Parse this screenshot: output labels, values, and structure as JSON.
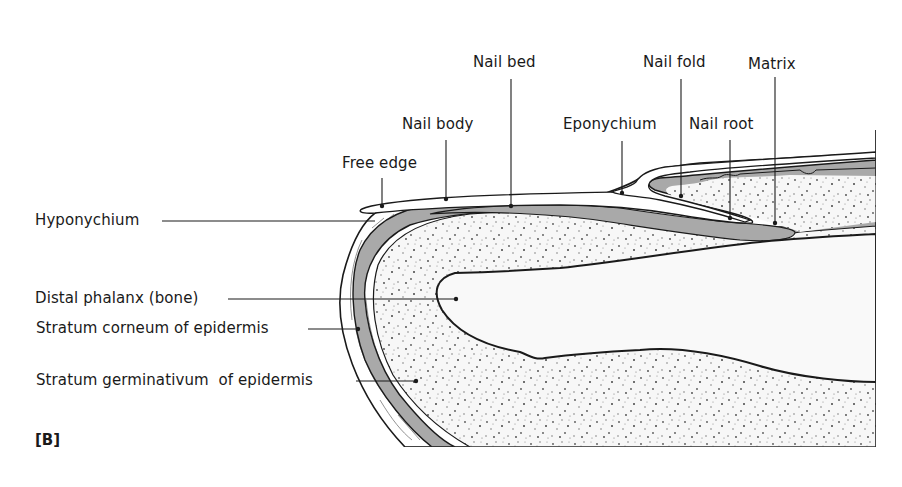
{
  "figure": {
    "panel_tag": "[B]"
  },
  "labels": {
    "top": [
      {
        "id": "nail-bed",
        "text": "Nail bed"
      },
      {
        "id": "nail-body",
        "text": "Nail body"
      },
      {
        "id": "free-edge",
        "text": "Free edge"
      },
      {
        "id": "eponychium",
        "text": "Eponychium"
      },
      {
        "id": "nail-fold",
        "text": "Nail fold"
      },
      {
        "id": "nail-root",
        "text": "Nail root"
      },
      {
        "id": "matrix",
        "text": "Matrix"
      }
    ],
    "left": [
      {
        "id": "hyponychium",
        "text": "Hyponychium"
      },
      {
        "id": "distal-phalanx",
        "text": "Distal phalanx (bone)"
      },
      {
        "id": "stratum-corneum",
        "text": "Stratum corneum of epidermis"
      },
      {
        "id": "stratum-germinativum",
        "text": "Stratum germinativum  of epidermis"
      }
    ]
  },
  "colors": {
    "line": "#1a1a1a",
    "germinal_layer": "#a9a9a9",
    "dermis_fill": "#f7f7f7",
    "stipple": "#555555",
    "bone_fill": "#f9f9f9",
    "background": "#ffffff"
  }
}
